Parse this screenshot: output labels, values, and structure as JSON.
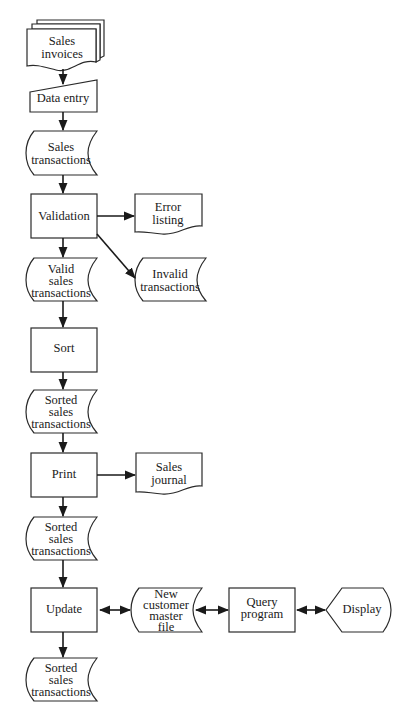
{
  "diagram": {
    "type": "system flowchart",
    "nodes": {
      "sales_invoices": {
        "shape": "document-stack",
        "lines": [
          "Sales",
          "invoices"
        ]
      },
      "data_entry": {
        "shape": "manual-input",
        "lines": [
          "Data entry"
        ]
      },
      "sales_transactions": {
        "shape": "stored-data",
        "lines": [
          "Sales",
          "transactions"
        ]
      },
      "validation": {
        "shape": "process",
        "lines": [
          "Validation"
        ]
      },
      "error_listing": {
        "shape": "document",
        "lines": [
          "Error",
          "listing"
        ]
      },
      "valid_sales_transactions": {
        "shape": "stored-data",
        "lines": [
          "Valid",
          "sales",
          "transactions"
        ]
      },
      "invalid_transactions": {
        "shape": "stored-data",
        "lines": [
          "Invalid",
          "transactions"
        ]
      },
      "sort": {
        "shape": "process",
        "lines": [
          "Sort"
        ]
      },
      "sorted_sales_transactions_1": {
        "shape": "stored-data",
        "lines": [
          "Sorted",
          "sales",
          "transactions"
        ]
      },
      "print": {
        "shape": "process",
        "lines": [
          "Print"
        ]
      },
      "sales_journal": {
        "shape": "document",
        "lines": [
          "Sales",
          "journal"
        ]
      },
      "sorted_sales_transactions_2": {
        "shape": "stored-data",
        "lines": [
          "Sorted",
          "sales",
          "transactions"
        ]
      },
      "update": {
        "shape": "process",
        "lines": [
          "Update"
        ]
      },
      "new_customer_master_file": {
        "shape": "stored-data",
        "lines": [
          "New",
          "customer",
          "master",
          "file"
        ]
      },
      "query_program": {
        "shape": "process",
        "lines": [
          "Query",
          "program"
        ]
      },
      "display": {
        "shape": "display",
        "lines": [
          "Display"
        ]
      },
      "sorted_sales_transactions_3": {
        "shape": "stored-data",
        "lines": [
          "Sorted",
          "sales",
          "transactions"
        ]
      }
    },
    "edges": [
      {
        "from": "sales_invoices",
        "to": "data_entry",
        "direction": "one-way"
      },
      {
        "from": "data_entry",
        "to": "sales_transactions",
        "direction": "one-way"
      },
      {
        "from": "sales_transactions",
        "to": "validation",
        "direction": "one-way"
      },
      {
        "from": "validation",
        "to": "error_listing",
        "direction": "one-way"
      },
      {
        "from": "validation",
        "to": "invalid_transactions",
        "direction": "one-way"
      },
      {
        "from": "validation",
        "to": "valid_sales_transactions",
        "direction": "one-way"
      },
      {
        "from": "valid_sales_transactions",
        "to": "sort",
        "direction": "one-way"
      },
      {
        "from": "sort",
        "to": "sorted_sales_transactions_1",
        "direction": "one-way"
      },
      {
        "from": "sorted_sales_transactions_1",
        "to": "print",
        "direction": "one-way"
      },
      {
        "from": "print",
        "to": "sales_journal",
        "direction": "one-way"
      },
      {
        "from": "print",
        "to": "sorted_sales_transactions_2",
        "direction": "one-way"
      },
      {
        "from": "sorted_sales_transactions_2",
        "to": "update",
        "direction": "one-way"
      },
      {
        "from": "update",
        "to": "new_customer_master_file",
        "direction": "two-way"
      },
      {
        "from": "new_customer_master_file",
        "to": "query_program",
        "direction": "two-way"
      },
      {
        "from": "query_program",
        "to": "display",
        "direction": "two-way"
      },
      {
        "from": "update",
        "to": "sorted_sales_transactions_3",
        "direction": "one-way"
      }
    ]
  }
}
